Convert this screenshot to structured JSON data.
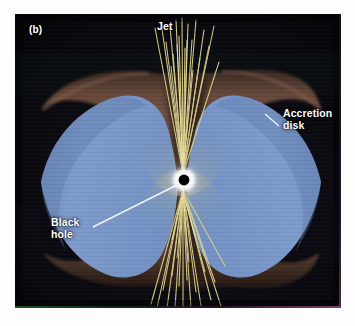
{
  "figure": {
    "panel_id": "(b)",
    "background_color": "#07070a",
    "page_background": "#fdfdfd"
  },
  "labels": {
    "jet": "Jet",
    "accretion_disk": "Accretion\ndisk",
    "black_hole": "Black\nhole",
    "panel_id": "(b)"
  },
  "colors": {
    "disk_blue": "#7a97c8",
    "disk_blue_dark": "#5d7cae",
    "funnel_brown": "#4a3228",
    "funnel_brown_light": "#7d5a49",
    "jet_yellow": "#d9d08a",
    "jet_yellow_bright": "#efe7ae",
    "glow_white": "#ffffff",
    "black_hole_core": "#000000",
    "label_text": "#ffffff",
    "leader_line": "#f2f4ff"
  },
  "elements": {
    "black_hole": {
      "name": "black-hole",
      "center_x": 169,
      "center_y": 166,
      "core_radius": 5,
      "glow_radius": 17
    },
    "accretion_disk": {
      "name": "accretion-disk",
      "description": "two-lobed blue saddle-shaped disk seen nearly edge-on"
    },
    "jet_upper": {
      "name": "jet-upper",
      "direction": "up",
      "strand_count": 17
    },
    "jet_lower": {
      "name": "jet-lower",
      "direction": "down",
      "strand_count": 17
    },
    "leaders": {
      "accretion_disk_leader": "short line from label down-left to disk rim",
      "black_hole_leader": "long line from label up-right to black hole"
    }
  }
}
